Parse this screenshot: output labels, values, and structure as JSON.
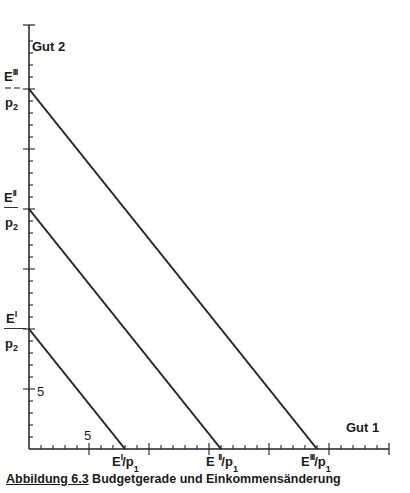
{
  "chart_data": {
    "type": "line",
    "title": "",
    "caption": {
      "figure_label": "Abbildung 6.3",
      "text": "Budgetgerade und Einkommensänderung"
    },
    "xlabel": "Gut 1",
    "ylabel": "Gut 2",
    "xlim": [
      0,
      30
    ],
    "ylim": [
      0,
      35
    ],
    "grid": false,
    "legend": null,
    "x_tick_labels": [
      {
        "value": 5,
        "label": "5"
      }
    ],
    "y_tick_labels": [
      {
        "value": 5,
        "label": "5"
      }
    ],
    "x_minor_tick_step": 1,
    "x_major_tick_step": 5,
    "y_minor_tick_step": 1,
    "y_major_tick_step": 5,
    "series": [
      {
        "name": "Budgetgerade I",
        "points": [
          [
            0,
            10
          ],
          [
            8,
            0
          ]
        ],
        "y_intercept_label": "E^I / p_2",
        "x_intercept_label": "E^I/p_1"
      },
      {
        "name": "Budgetgerade II",
        "points": [
          [
            0,
            20
          ],
          [
            16,
            0
          ]
        ],
        "y_intercept_label": "E^II / p_2",
        "x_intercept_label": "E^II/p_1"
      },
      {
        "name": "Budgetgerade III",
        "points": [
          [
            0,
            30
          ],
          [
            24,
            0
          ]
        ],
        "y_intercept_label": "E^III / p_2",
        "x_intercept_label": "E^III/p_1"
      }
    ]
  },
  "labels": {
    "y_axis": "Gut 2",
    "x_axis": "Gut 1",
    "tick_x_5": "5",
    "tick_y_5": "5",
    "e_letter": "E",
    "p_letter": "p",
    "sub_1": "1",
    "sub_2": "2",
    "sup_I": "I",
    "sup_II": "II",
    "sup_III": "III",
    "slash": "/"
  },
  "caption": {
    "figure_label": "Abbildung 6.3",
    "text": " Budgetgerade und Einkommensänderung"
  }
}
